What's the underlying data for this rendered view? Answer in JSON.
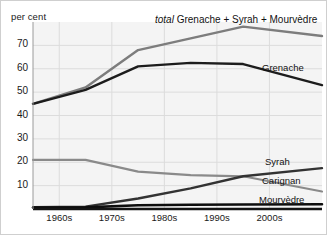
{
  "chart_data": {
    "type": "line",
    "title": "total Grenache + Syrah + Mourvèdre",
    "title_italic_prefix": "total",
    "title_rest": " Grenache + Syrah + Mourvèdre",
    "ylabel": "per cent",
    "xlabel": "",
    "categories": [
      "1960s",
      "1970s",
      "1980s",
      "1990s",
      "2000s"
    ],
    "x": [
      1960,
      1970,
      1980,
      1990,
      2000
    ],
    "xlim": [
      1955,
      2010
    ],
    "ylim": [
      0,
      80
    ],
    "yticks": [
      10,
      20,
      30,
      40,
      50,
      60,
      70
    ],
    "ytick_labels": [
      "10",
      "20",
      "30",
      "40",
      "50",
      "60",
      "70"
    ],
    "grid": true,
    "legend": "inline-right",
    "series": [
      {
        "name": "total Grenache + Syrah + Mourvèdre",
        "label": "total Grenache + Syrah + Mourvèdre",
        "color": "#7d7d7d",
        "width": 2.4,
        "x": [
          1955,
          1965,
          1975,
          1985,
          1995,
          2010
        ],
        "values": [
          45,
          52,
          68,
          73,
          78,
          74
        ]
      },
      {
        "name": "Grenache",
        "label": "Grenache",
        "color": "#1c1c1c",
        "width": 2.4,
        "x": [
          1955,
          1965,
          1975,
          1985,
          1995,
          2010
        ],
        "values": [
          45,
          51,
          61,
          62.5,
          62,
          53
        ]
      },
      {
        "name": "Carignan",
        "label": "Carignan",
        "color": "#8a8a8a",
        "width": 2.2,
        "x": [
          1955,
          1965,
          1975,
          1985,
          1995,
          2010
        ],
        "values": [
          21,
          21,
          16,
          14.5,
          14,
          7.5
        ]
      },
      {
        "name": "Syrah",
        "label": "Syrah",
        "color": "#333333",
        "width": 2.4,
        "x": [
          1955,
          1965,
          1975,
          1985,
          1995,
          2010
        ],
        "values": [
          0.8,
          1.0,
          4.5,
          8.8,
          14,
          17.5
        ]
      },
      {
        "name": "Mourvèdre",
        "label": "Mourvèdre",
        "color": "#0d0d0d",
        "width": 2.6,
        "x": [
          1955,
          1965,
          1975,
          1985,
          1995,
          2010
        ],
        "values": [
          0.6,
          0.7,
          1.6,
          1.8,
          1.9,
          2.0
        ]
      }
    ],
    "series_labels_inline": [
      {
        "name": "total",
        "text": "total Grenache + Syrah + Mourvèdre"
      },
      {
        "name": "grenache",
        "text": "Grenache"
      },
      {
        "name": "syrah",
        "text": "Syrah"
      },
      {
        "name": "carignan",
        "text": "Carignan"
      },
      {
        "name": "mourvedre",
        "text": "Mourvèdre"
      }
    ],
    "colors": {
      "total": "#7d7d7d",
      "grenache": "#1c1c1c",
      "carignan": "#8a8a8a",
      "syrah": "#333333",
      "mourvedre": "#0d0d0d",
      "grid": "#dcdcdc",
      "plot_background": "#f4f4f4",
      "axis": "#1a1a1a",
      "text": "#1a1a1a"
    }
  }
}
